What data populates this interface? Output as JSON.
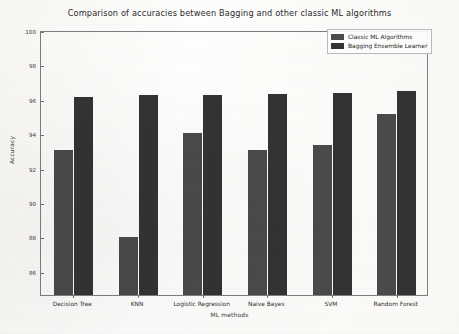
{
  "chart_data": {
    "type": "bar",
    "title": "Comparison of accuracies between Bagging and other classic ML algorithms",
    "xlabel": "ML methods",
    "ylabel": "Accuracy",
    "categories": [
      "Decision Tree",
      "KNN",
      "Logistic Regression",
      "Naive Bayes",
      "SVM",
      "Random Forest"
    ],
    "series": [
      {
        "name": "Classic ML Algorithms",
        "color": "#4a4a4a",
        "values": [
          93.0,
          88.0,
          94.0,
          93.0,
          93.3,
          95.1
        ]
      },
      {
        "name": "Bagging Ensemble Learner",
        "color": "#333333",
        "values": [
          96.1,
          96.2,
          96.25,
          96.3,
          96.35,
          96.45
        ]
      }
    ],
    "ylim": [
      84.6,
      100
    ],
    "yticks": [
      100,
      98,
      96,
      94,
      92,
      90,
      88,
      86
    ],
    "ytick_labels": [
      "100",
      "98",
      "96",
      "94",
      "92",
      "90",
      "88",
      "86"
    ],
    "grid": false,
    "legend_position": "upper right"
  },
  "legend": {
    "entries": [
      {
        "label": "Classic ML Algorithms"
      },
      {
        "label": "Bagging Ensemble Learner"
      }
    ]
  }
}
